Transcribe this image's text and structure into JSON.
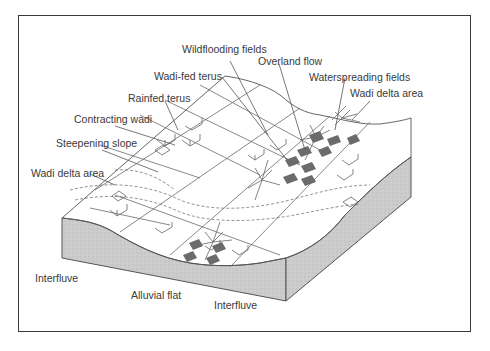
{
  "diagram": {
    "type": "block-diagram",
    "labels": {
      "wildflooding_fields": "Wildflooding fields",
      "overland_flow": "Overland flow",
      "wadi_fed_terus": "Wadi-fed terus",
      "waterspreading_fields": "Waterspreading fields",
      "wadi_delta_area_upper": "Wadi delta area",
      "rainfed_terus": "Rainfed terus",
      "contracting_wadi": "Contracting wadi",
      "steepening_slope": "Steepening slope",
      "wadi_delta_area_left": "Wadi delta area",
      "interfluve_left": "Interfluve",
      "alluvial_flat": "Alluvial flat",
      "interfluve_right": "Interfluve"
    },
    "colors": {
      "outline": "#4a4a4a",
      "block_side": "#c9c9c9",
      "field_fill": "#6b6b6b",
      "surface": "#ffffff",
      "text": "#3a3a3a"
    }
  }
}
